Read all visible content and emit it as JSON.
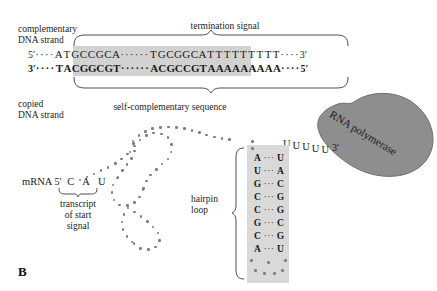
{
  "figure": {
    "panel_letter": "B"
  },
  "annotations": {
    "complementary_strand_label": "complementary\nDNA strand",
    "copied_strand_label": "copied\nDNA strand",
    "termination_signal_label": "termination signal",
    "self_complementary_label": "self-complementary sequence",
    "hairpin_loop_label": "hairpin\nloop",
    "transcript_start_label": "transcript\nof start\nsignal",
    "rna_polymerase_label": "RNA polymerase",
    "mrna_label": "mRNA"
  },
  "dna": {
    "top_strand": {
      "five_prime": "5′",
      "three_prime": "3′",
      "lead_dots": "····",
      "palindrome_left": [
        "A",
        "T",
        "G",
        "C",
        "C",
        "G",
        "C",
        "A"
      ],
      "spacer_dots": "······",
      "palindrome_right": [
        "T",
        "G",
        "C",
        "G",
        "G",
        "C",
        "A",
        "T"
      ],
      "poly_tract": [
        "T",
        "T",
        "T",
        "T",
        "T",
        "T",
        "T",
        "T"
      ],
      "tail_dots": "····"
    },
    "bottom_strand": {
      "five_prime": "5′",
      "three_prime": "3′",
      "lead_dots": "····",
      "palindrome_left": [
        "T",
        "A",
        "C",
        "G",
        "G",
        "C",
        "G",
        "T"
      ],
      "spacer_dots": "······",
      "palindrome_right": [
        "A",
        "C",
        "G",
        "C",
        "C",
        "G",
        "T",
        "A"
      ],
      "poly_tract": [
        "A",
        "A",
        "A",
        "A",
        "A",
        "A",
        "A",
        "A"
      ],
      "tail_dots": "····"
    }
  },
  "mrna": {
    "five_prime": "5′",
    "three_prime": "3′",
    "start_bases": [
      "C",
      "A",
      "U"
    ],
    "terminal_u_tract": [
      "U",
      "U",
      "U",
      "U",
      "U"
    ]
  },
  "hairpin": {
    "base_pairs": [
      {
        "left": "A",
        "bond": "···",
        "right": "U"
      },
      {
        "left": "U",
        "bond": "···",
        "right": "A"
      },
      {
        "left": "G",
        "bond": "···",
        "right": "C"
      },
      {
        "left": "C",
        "bond": "···",
        "right": "G"
      },
      {
        "left": "C",
        "bond": "···",
        "right": "G"
      },
      {
        "left": "G",
        "bond": "···",
        "right": "C"
      },
      {
        "left": "C",
        "bond": "···",
        "right": "G"
      },
      {
        "left": "A",
        "bond": "···",
        "right": "U"
      }
    ]
  },
  "colors": {
    "shade_gray": "#d2d2d2",
    "hairpin_gray": "#d9d9d9",
    "polymerase_gray": "#8e8e8e",
    "dot_gray": "#7d7d7d",
    "text": "#1a1a1a"
  }
}
